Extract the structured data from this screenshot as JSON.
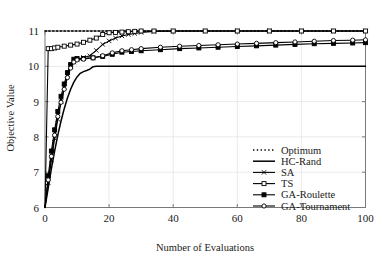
{
  "chart_data": {
    "type": "line",
    "title": "",
    "xlabel": "Number of Evaluations",
    "ylabel": "Objective Value",
    "xlim": [
      0,
      100
    ],
    "ylim": [
      6,
      11
    ],
    "xticks": [
      0,
      20,
      40,
      60,
      80,
      100
    ],
    "yticks": [
      6,
      7,
      8,
      9,
      10,
      11
    ],
    "grid": true,
    "legend_position": "lower right",
    "series": [
      {
        "name": "Optimum",
        "style": "dotted",
        "marker": "none",
        "color": "#000000",
        "x": [
          0,
          10,
          20,
          30,
          40,
          50,
          60,
          70,
          80,
          90,
          100
        ],
        "values": [
          11,
          11,
          11,
          11,
          11,
          11,
          11,
          11,
          11,
          11,
          11
        ]
      },
      {
        "name": "HC-Rand",
        "style": "solid",
        "marker": "none",
        "color": "#000000",
        "x": [
          0,
          1,
          2,
          3,
          4,
          5,
          6,
          7,
          8,
          9,
          10,
          11,
          12,
          13,
          14,
          15,
          16,
          20,
          30,
          40,
          50,
          60,
          70,
          80,
          90,
          100
        ],
        "values": [
          6.0,
          6.55,
          7.1,
          7.6,
          8.05,
          8.45,
          8.8,
          9.1,
          9.35,
          9.55,
          9.7,
          9.8,
          9.85,
          9.88,
          9.92,
          9.99,
          10.0,
          10.0,
          10.0,
          10.0,
          10.0,
          10.0,
          10.0,
          10.0,
          10.0,
          10.0
        ]
      },
      {
        "name": "SA",
        "style": "solid",
        "marker": "x",
        "color": "#000000",
        "x": [
          0,
          1,
          2,
          3,
          4,
          5,
          6,
          7,
          8,
          9,
          10,
          12,
          14,
          16,
          18,
          20,
          22,
          24,
          26,
          28,
          30,
          34,
          40,
          50,
          60,
          70,
          80,
          90,
          100
        ],
        "values": [
          6.0,
          6.7,
          7.35,
          7.95,
          8.5,
          9.0,
          9.4,
          9.75,
          10.0,
          10.12,
          10.2,
          10.25,
          10.3,
          10.45,
          10.62,
          10.72,
          10.8,
          10.86,
          10.9,
          10.93,
          10.96,
          10.99,
          11.0,
          11.0,
          11.0,
          11.0,
          11.0,
          11.0,
          11.0
        ]
      },
      {
        "name": "TS",
        "style": "solid",
        "marker": "square-open",
        "color": "#000000",
        "x": [
          0,
          1,
          2,
          3,
          4,
          6,
          8,
          10,
          12,
          14,
          16,
          18,
          20,
          22,
          24,
          26,
          28,
          30,
          34,
          40,
          50,
          60,
          70,
          80,
          90,
          100
        ],
        "values": [
          6.0,
          10.5,
          10.5,
          10.52,
          10.54,
          10.57,
          10.6,
          10.63,
          10.68,
          10.74,
          10.8,
          10.9,
          10.95,
          10.96,
          10.97,
          10.98,
          10.99,
          11.0,
          11.0,
          11.0,
          11.0,
          11.0,
          11.0,
          11.0,
          11.0,
          11.0
        ]
      },
      {
        "name": "GA-Roulette",
        "style": "solid",
        "marker": "square-filled",
        "color": "#000000",
        "x": [
          0,
          1,
          2,
          3,
          4,
          5,
          6,
          7,
          8,
          9,
          10,
          12,
          15,
          18,
          21,
          24,
          27,
          30,
          36,
          42,
          48,
          54,
          60,
          66,
          72,
          78,
          84,
          90,
          96,
          100
        ],
        "values": [
          6.0,
          6.9,
          7.6,
          8.2,
          8.72,
          9.15,
          9.5,
          9.82,
          10.05,
          10.2,
          10.22,
          10.22,
          10.24,
          10.28,
          10.34,
          10.4,
          10.42,
          10.44,
          10.47,
          10.5,
          10.52,
          10.54,
          10.56,
          10.58,
          10.6,
          10.62,
          10.64,
          10.65,
          10.66,
          10.67
        ]
      },
      {
        "name": "GA-Tournament",
        "style": "solid",
        "marker": "circle-open",
        "color": "#000000",
        "x": [
          0,
          1,
          2,
          3,
          4,
          5,
          6,
          7,
          8,
          9,
          10,
          12,
          15,
          18,
          21,
          24,
          27,
          30,
          36,
          42,
          48,
          54,
          60,
          66,
          72,
          78,
          84,
          90,
          96,
          100
        ],
        "values": [
          6.0,
          6.78,
          7.45,
          8.05,
          8.58,
          8.98,
          9.35,
          9.68,
          9.95,
          10.12,
          10.18,
          10.2,
          10.24,
          10.3,
          10.38,
          10.44,
          10.47,
          10.5,
          10.54,
          10.57,
          10.59,
          10.61,
          10.63,
          10.65,
          10.67,
          10.69,
          10.71,
          10.73,
          10.74,
          10.75
        ]
      }
    ]
  },
  "legend": {
    "items": [
      {
        "label": "Optimum"
      },
      {
        "label": "HC-Rand"
      },
      {
        "label": "SA"
      },
      {
        "label": "TS"
      },
      {
        "label": "GA-Roulette"
      },
      {
        "label": "GA-Tournament"
      }
    ]
  },
  "colors": {
    "line": "#000000",
    "grid": "#e8e8e8",
    "axis": "#7a7a7a",
    "text": "#1a1a1a",
    "background": "#ffffff"
  }
}
